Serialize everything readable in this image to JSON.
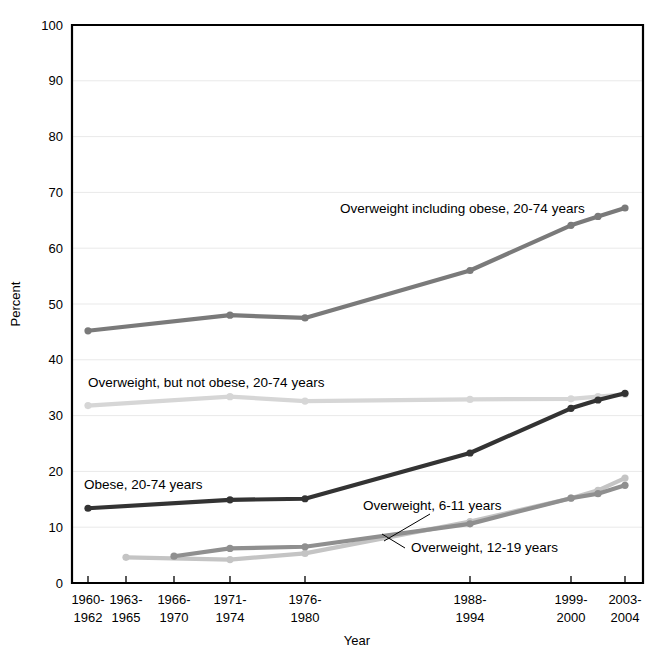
{
  "chart_data": {
    "type": "line",
    "title": "",
    "xlabel": "Year",
    "ylabel": "Percent",
    "ylim": [
      0,
      100
    ],
    "yticks": [
      0,
      10,
      20,
      30,
      40,
      50,
      60,
      70,
      80,
      90,
      100
    ],
    "grid": true,
    "legend_position": "inline-labels",
    "categories": [
      "1960-1962",
      "1963-1965",
      "1966-1970",
      "1971-1974",
      "1976-1980",
      "1988-1994",
      "1999-2000",
      "2001-2002",
      "2003-2004"
    ],
    "tick_labels": [
      {
        "line1": "1960-",
        "line2": "1962"
      },
      {
        "line1": "1963-",
        "line2": "1965"
      },
      {
        "line1": "1966-",
        "line2": "1970"
      },
      {
        "line1": "1971-",
        "line2": "1974"
      },
      {
        "line1": "1976-",
        "line2": "1980"
      },
      {
        "line1": "1988-",
        "line2": "1994"
      },
      {
        "line1": "1999-",
        "line2": "2000"
      },
      {
        "line1": "2003-",
        "line2": "2004"
      }
    ],
    "series": [
      {
        "name": "Overweight including obese, 20-74 years",
        "label": "Overweight including obese, 20-74 years",
        "color": "#7a7a7a",
        "x": [
          "1960-1962",
          "1971-1974",
          "1976-1980",
          "1988-1994",
          "1999-2000",
          "2001-2002",
          "2003-2004"
        ],
        "values": [
          45.2,
          48.0,
          47.5,
          56.0,
          64.1,
          65.7,
          67.2
        ]
      },
      {
        "name": "Overweight, but not obese, 20-74 years",
        "label": "Overweight, but not obese, 20-74 years",
        "color": "#d6d6d6",
        "x": [
          "1960-1962",
          "1971-1974",
          "1976-1980",
          "1988-1994",
          "1999-2000",
          "2001-2002",
          "2003-2004"
        ],
        "values": [
          31.8,
          33.4,
          32.6,
          32.9,
          33.0,
          33.4,
          33.8
        ]
      },
      {
        "name": "Obese, 20-74 years",
        "label": "Obese, 20-74 years",
        "color": "#333333",
        "x": [
          "1960-1962",
          "1971-1974",
          "1976-1980",
          "1988-1994",
          "1999-2000",
          "2001-2002",
          "2003-2004"
        ],
        "values": [
          13.4,
          14.9,
          15.1,
          23.3,
          31.3,
          32.8,
          34.0
        ]
      },
      {
        "name": "Overweight, 6-11 years",
        "label": "Overweight, 6-11 years",
        "color": "#c4c4c4",
        "x": [
          "1963-1965",
          "1971-1974",
          "1976-1980",
          "1988-1994",
          "1999-2000",
          "2001-2002",
          "2003-2004"
        ],
        "values": [
          4.6,
          4.2,
          5.3,
          11.0,
          15.2,
          16.6,
          18.8
        ]
      },
      {
        "name": "Overweight, 12-19 years",
        "label": "Overweight, 12-19 years",
        "color": "#8f8f8f",
        "x": [
          "1966-1970",
          "1971-1974",
          "1976-1980",
          "1988-1994",
          "1999-2000",
          "2001-2002",
          "2003-2004"
        ],
        "values": [
          4.8,
          6.2,
          6.5,
          10.6,
          15.2,
          16.0,
          17.5
        ]
      }
    ],
    "annotations": [
      {
        "text": "Overweight including obese, 20-74 years",
        "x": 340,
        "y": 213,
        "anchor": "start",
        "leader": false
      },
      {
        "text": "Overweight, but not obese, 20-74 years",
        "x": 88,
        "y": 387,
        "anchor": "start",
        "leader": false
      },
      {
        "text": "Obese, 20-74 years",
        "x": 84,
        "y": 489,
        "anchor": "start",
        "leader": false
      },
      {
        "text": "Overweight, 6-11 years",
        "x": 363,
        "y": 510,
        "anchor": "start",
        "leader": true
      },
      {
        "text": "Overweight, 12-19 years",
        "x": 411,
        "y": 552,
        "anchor": "start",
        "leader": true
      }
    ]
  },
  "geometry": {
    "plot_left": 72,
    "plot_right": 643,
    "plot_top": 25,
    "plot_bottom": 583,
    "x_positions": {
      "1960-1962": 88,
      "1963-1965": 126,
      "1966-1970": 174,
      "1971-1974": 230,
      "1976-1980": 305,
      "1988-1994": 470,
      "1999-2000": 571,
      "2001-2002": 598,
      "2003-2004": 625
    },
    "tick_x": [
      88,
      126,
      174,
      230,
      305,
      470,
      571,
      625
    ]
  }
}
